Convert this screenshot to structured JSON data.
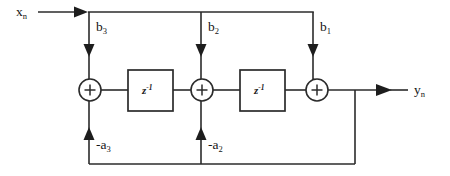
{
  "diagram": {
    "type": "signal-flow-graph",
    "colors": {
      "line": "#2b2b2b",
      "background": "#ffffff",
      "text": "#151515"
    },
    "input": {
      "label": "x",
      "subscript": "n"
    },
    "output": {
      "label": "y",
      "subscript": "n"
    },
    "feedforward_taps": [
      {
        "label": "b",
        "subscript": "3",
        "x": 89
      },
      {
        "label": "b",
        "subscript": "2",
        "x": 201
      },
      {
        "label": "b",
        "subscript": "1",
        "x": 313
      }
    ],
    "feedback_taps": [
      {
        "label": "-a",
        "subscript": "3",
        "x": 89
      },
      {
        "label": "-a",
        "subscript": "2",
        "x": 201
      }
    ],
    "delay_blocks": [
      {
        "label": "z",
        "exponent": "-1",
        "x": 128,
        "y": 70
      },
      {
        "label": "z",
        "exponent": "-1",
        "x": 240,
        "y": 70
      }
    ],
    "adders": [
      {
        "symbol": "+",
        "x": 90,
        "y": 90
      },
      {
        "symbol": "+",
        "x": 202,
        "y": 90
      },
      {
        "symbol": "+",
        "x": 317,
        "y": 90
      }
    ]
  }
}
